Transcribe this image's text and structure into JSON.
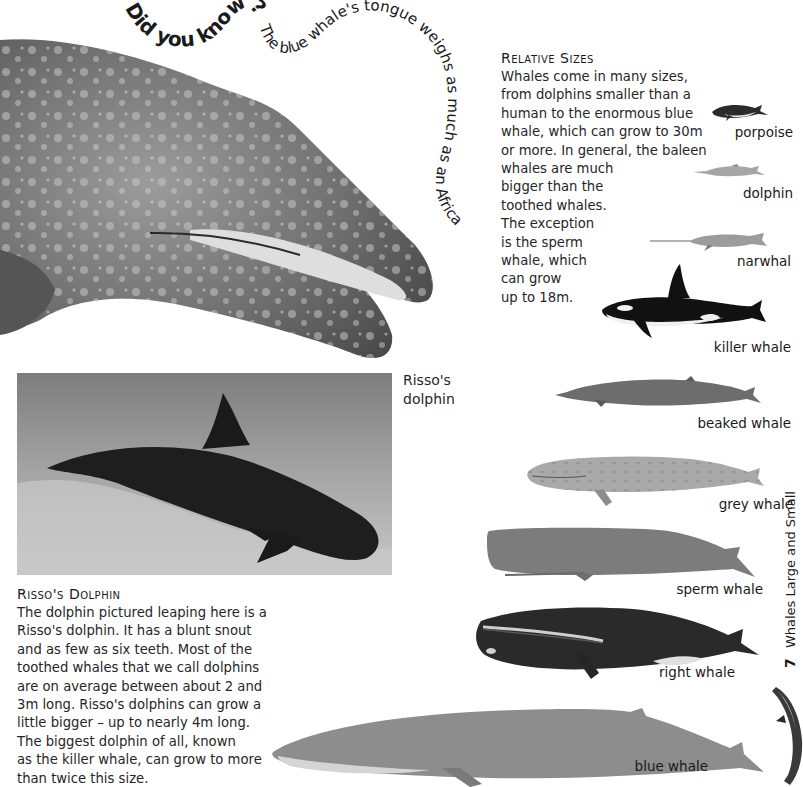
{
  "did_you_know": {
    "lead": "Did you know?",
    "text": "The blue whale's tongue weighs as much as an African elephant."
  },
  "relative_sizes": {
    "heading": "Relative Sizes",
    "lines": [
      "Whales come in many sizes,",
      "from dolphins smaller than a",
      "human to the enormous blue",
      "whale, which can grow to 30m",
      "or more. In general, the baleen",
      "whales are much",
      "bigger than the",
      "toothed whales.",
      "The exception",
      "is the sperm",
      "whale, which",
      "can grow",
      "up to 18m."
    ]
  },
  "photo_caption": {
    "line1": "Risso's",
    "line2": "dolphin"
  },
  "rissos_dolphin": {
    "heading": "Risso's Dolphin",
    "lines": [
      "The dolphin pictured leaping here is a",
      "Risso's dolphin. It has a blunt snout",
      "and as few as six teeth. Most of the",
      "toothed whales that we call dolphins",
      "are on average between about 2 and",
      "3m long. Risso's dolphins can grow a",
      "little bigger – up to nearly 4m long.",
      "The biggest dolphin of all, known",
      "as the killer whale, can grow to more",
      "than twice this size."
    ]
  },
  "whales": [
    {
      "label": "porpoise"
    },
    {
      "label": "dolphin"
    },
    {
      "label": "narwhal"
    },
    {
      "label": "killer whale"
    },
    {
      "label": "beaked whale"
    },
    {
      "label": "grey whale"
    },
    {
      "label": "sperm whale"
    },
    {
      "label": "right whale"
    },
    {
      "label": "blue whale"
    }
  ],
  "page": {
    "number": "7",
    "section_title": "Whales Large and Small"
  }
}
